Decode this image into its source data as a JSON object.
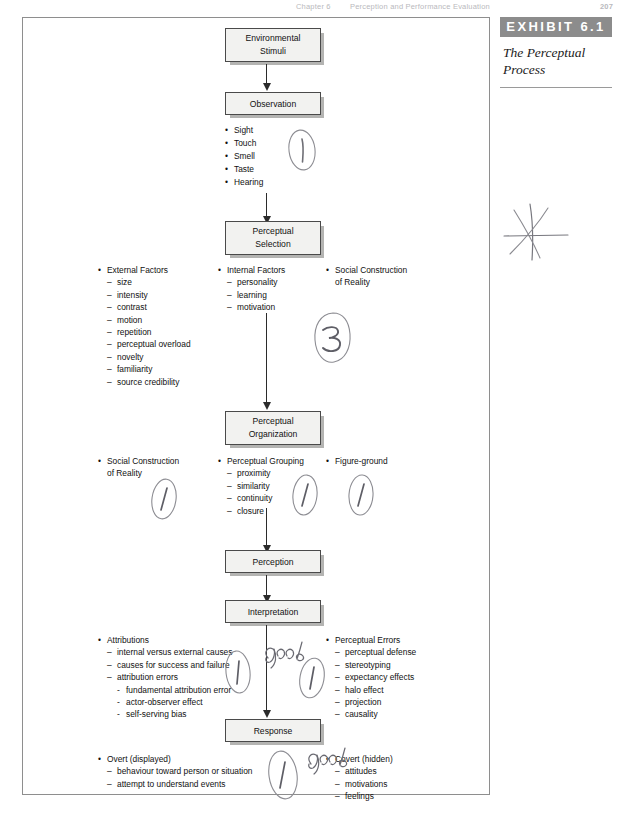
{
  "page_header": {
    "chapter": "Chapter 6",
    "title": "Perception and Performance Evaluation",
    "page_number": "207"
  },
  "caption": {
    "exhibit_label": "EXHIBIT 6.1",
    "title_line1": "The Perceptual",
    "title_line2": "Process"
  },
  "flow_boxes": {
    "environmental_stimuli": {
      "line1": "Environmental",
      "line2": "Stimuli"
    },
    "observation": {
      "line1": "Observation",
      "line2": ""
    },
    "perceptual_selection": {
      "line1": "Perceptual",
      "line2": "Selection"
    },
    "perceptual_organization": {
      "line1": "Perceptual",
      "line2": "Organization"
    },
    "perception": {
      "line1": "Perception",
      "line2": ""
    },
    "interpretation": {
      "line1": "Interpretation",
      "line2": ""
    },
    "response": {
      "line1": "Response",
      "line2": ""
    }
  },
  "senses": [
    "Sight",
    "Touch",
    "Smell",
    "Taste",
    "Hearing"
  ],
  "selection_factors": {
    "external": {
      "heading": "External Factors",
      "items": [
        "size",
        "intensity",
        "contrast",
        "motion",
        "repetition",
        "perceptual overload",
        "novelty",
        "familiarity",
        "source credibility"
      ]
    },
    "internal": {
      "heading": "Internal Factors",
      "items": [
        "personality",
        "learning",
        "motivation"
      ]
    },
    "social": {
      "heading_line1": "Social Construction",
      "heading_line2": "of Reality"
    }
  },
  "organization_factors": {
    "social": {
      "heading_line1": "Social Construction",
      "heading_line2": "of Reality"
    },
    "grouping": {
      "heading": "Perceptual Grouping",
      "items": [
        "proximity",
        "similarity",
        "continuity",
        "closure"
      ]
    },
    "figure_ground": {
      "heading": "Figure-ground"
    }
  },
  "interpretation_factors": {
    "attributions": {
      "heading": "Attributions",
      "items": [
        {
          "text": "internal versus external causes",
          "level": 2
        },
        {
          "text": "causes for success and failure",
          "level": 2
        },
        {
          "text": "attribution errors",
          "level": 2
        },
        {
          "text": "fundamental attribution error",
          "level": 3
        },
        {
          "text": "actor-observer effect",
          "level": 3
        },
        {
          "text": "self-serving bias",
          "level": 3
        }
      ]
    },
    "errors": {
      "heading": "Perceptual Errors",
      "items": [
        "perceptual defense",
        "stereotyping",
        "expectancy effects",
        "halo effect",
        "projection",
        "causality"
      ]
    }
  },
  "response_factors": {
    "overt": {
      "heading": "Overt (displayed)",
      "items": [
        "behaviour toward person or situation",
        "attempt to understand events"
      ]
    },
    "covert": {
      "heading": "Covert (hidden)",
      "items": [
        "attitudes",
        "motivations",
        "feelings"
      ]
    }
  },
  "annotations": {
    "circled_1_senses": "1",
    "circled_3_selection": "3",
    "circled_1_social_org": "1",
    "circled_1_grouping": "1",
    "circled_1_figure_ground": "1",
    "circled_1_attributions": "1",
    "good_attributions": "good",
    "circled_1_errors": "1",
    "circled_1_response": "1",
    "good_response": "good",
    "star_mark": "star"
  },
  "colors": {
    "box_fill": "#f2f2f0",
    "box_border": "#4a4a4a",
    "box_shadow": "#b4b4b2",
    "exhibit_bar": "#8c8c8c",
    "frame_border": "#8e8e8e",
    "ink": "#111111",
    "handwriting": "#6a6a70"
  }
}
